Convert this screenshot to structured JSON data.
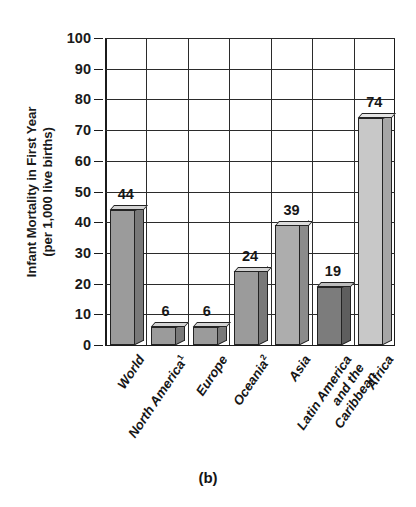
{
  "caption": "(b)",
  "chart_data": {
    "type": "bar",
    "title": "",
    "xlabel": "",
    "ylabel_line1": "Infant Mortality in First Year",
    "ylabel_line2": "(per 1,000 live births)",
    "ylim": [
      0,
      100
    ],
    "ytick_step": 10,
    "yticks": [
      "100",
      "90",
      "80",
      "70",
      "60",
      "50",
      "40",
      "30",
      "20",
      "10",
      "0"
    ],
    "grid": true,
    "legend": "none",
    "categories": [
      "World",
      "North America",
      "Europe",
      "Oceania",
      "Asia",
      "Latin America and the Caribbean",
      "Africa"
    ],
    "category_labels": [
      {
        "lines": [
          "World"
        ],
        "footnote": ""
      },
      {
        "lines": [
          "North America"
        ],
        "footnote": "1"
      },
      {
        "lines": [
          "Europe"
        ],
        "footnote": ""
      },
      {
        "lines": [
          "Oceania"
        ],
        "footnote": "2"
      },
      {
        "lines": [
          "Asia"
        ],
        "footnote": ""
      },
      {
        "lines": [
          "Latin America",
          "and the",
          "Caribbean"
        ],
        "footnote": ""
      },
      {
        "lines": [
          "Africa"
        ],
        "footnote": ""
      }
    ],
    "values": [
      44,
      6,
      6,
      24,
      39,
      19,
      74
    ],
    "value_labels": [
      "44",
      "6",
      "6",
      "24",
      "39",
      "19",
      "74"
    ],
    "bar_colors": [
      "#9b9b9b",
      "#9b9b9b",
      "#9b9b9b",
      "#9b9b9b",
      "#adadad",
      "#7c7c7c",
      "#c8c8c8"
    ],
    "bar_top_colors": [
      "#d3d3d3",
      "#d3d3d3",
      "#d3d3d3",
      "#d3d3d3",
      "#dcdcdc",
      "#bdbdbd",
      "#e4e4e4"
    ],
    "bar_side_colors": [
      "#797979",
      "#797979",
      "#797979",
      "#797979",
      "#8b8b8b",
      "#5e5e5e",
      "#a6a6a6"
    ]
  }
}
